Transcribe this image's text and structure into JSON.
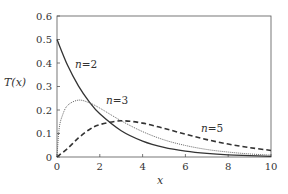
{
  "chart_data": {
    "type": "line",
    "title": "",
    "xlabel": "x",
    "ylabel": "T(x)",
    "xlim": [
      0,
      10
    ],
    "ylim": [
      0,
      0.6
    ],
    "xticks": [
      "0",
      "2",
      "4",
      "6",
      "8",
      "10"
    ],
    "yticks": [
      "0",
      "0.1",
      "0.2",
      "0.3",
      "0.4",
      "0.5",
      "0.6"
    ],
    "grid": false,
    "legend": "none (inline curve labels)",
    "series": [
      {
        "name": "n=2",
        "style": "solid",
        "x": [
          0,
          0.5,
          1,
          1.5,
          2,
          3,
          4,
          5,
          6,
          7,
          8,
          9,
          10
        ],
        "values": [
          0.5,
          0.389,
          0.303,
          0.236,
          0.184,
          0.112,
          0.068,
          0.041,
          0.025,
          0.015,
          0.009,
          0.006,
          0.003
        ]
      },
      {
        "name": "n=3",
        "style": "dotted",
        "x": [
          0,
          0.1,
          0.25,
          0.5,
          1,
          1.5,
          2,
          3,
          4,
          5,
          6,
          7,
          8,
          9,
          10
        ],
        "values": [
          0,
          0.12,
          0.176,
          0.22,
          0.242,
          0.231,
          0.208,
          0.154,
          0.108,
          0.073,
          0.049,
          0.032,
          0.021,
          0.013,
          0.008
        ]
      },
      {
        "name": "n=5",
        "style": "dashed",
        "x": [
          0,
          0.5,
          1,
          1.5,
          2,
          3,
          4,
          5,
          6,
          7,
          8,
          9,
          10
        ],
        "values": [
          0,
          0.037,
          0.081,
          0.116,
          0.138,
          0.154,
          0.144,
          0.122,
          0.097,
          0.074,
          0.055,
          0.04,
          0.028
        ]
      }
    ],
    "annotations": [
      {
        "text": "n=2",
        "x": 1.3,
        "y": 0.45
      },
      {
        "text": "n=3",
        "x": 3.0,
        "y": 0.27
      },
      {
        "text": "n=5",
        "x": 7.0,
        "y": 0.17
      }
    ]
  },
  "labels": {
    "x_axis": "x",
    "y_axis": "T(x)",
    "n2_var": "n",
    "n2_val": "=2",
    "n3_var": "n",
    "n3_val": "=3",
    "n5_var": "n",
    "n5_val": "=5"
  }
}
